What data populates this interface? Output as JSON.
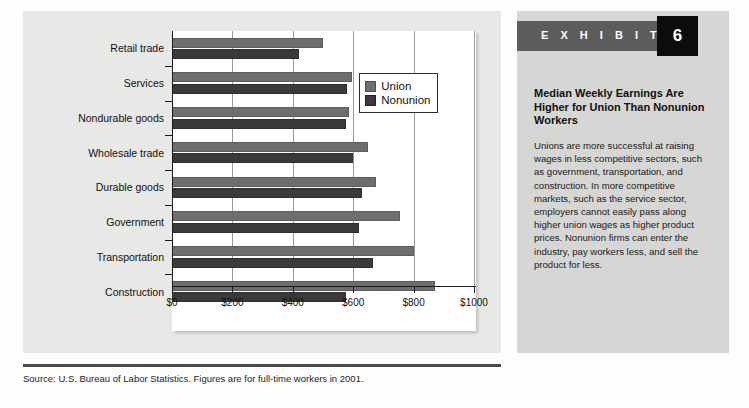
{
  "exhibit": {
    "label": "E X H I B I T",
    "number": "6",
    "title": "Median Weekly Earnings Are Higher for Union Than Nonunion Workers",
    "body": "Unions are more successful at raising wages in less competitive sectors, such as government, transportation, and construction. In more competitive markets, such as the service sector, employers cannot easily pass along higher union wages as higher product prices. Nonunion firms can enter the industry, pay workers less, and sell the product for less."
  },
  "source_note": "Source: U.S. Bureau of Labor Statistics. Figures are for full-time workers in 2001.",
  "colors": {
    "union": "#6e6e6e",
    "nonunion": "#3a3a3a",
    "panel": "#e8e8e6",
    "exhibit_panel": "#d6d6d4",
    "exhibit_bar": "#5c5c5c",
    "exhibit_number_box": "#0d0d0d"
  },
  "chart_data": {
    "type": "bar",
    "orientation": "horizontal",
    "title": "",
    "xlabel": "",
    "ylabel": "",
    "xlim": [
      0,
      1000
    ],
    "xticks": [
      0,
      200,
      400,
      600,
      800,
      1000
    ],
    "xtick_labels": [
      "$0",
      "$200",
      "$400",
      "$600",
      "$800",
      "$1000"
    ],
    "grid": true,
    "legend_position": "inside-upper-right",
    "categories": [
      "Retail trade",
      "Services",
      "Nondurable goods",
      "Wholesale trade",
      "Durable goods",
      "Government",
      "Transportation",
      "Construction"
    ],
    "series": [
      {
        "name": "Union",
        "color": "#6e6e6e",
        "values": [
          500,
          595,
          585,
          650,
          675,
          755,
          800,
          870
        ]
      },
      {
        "name": "Nonunion",
        "color": "#3a3a3a",
        "values": [
          420,
          580,
          575,
          600,
          630,
          620,
          665,
          575
        ]
      }
    ]
  }
}
